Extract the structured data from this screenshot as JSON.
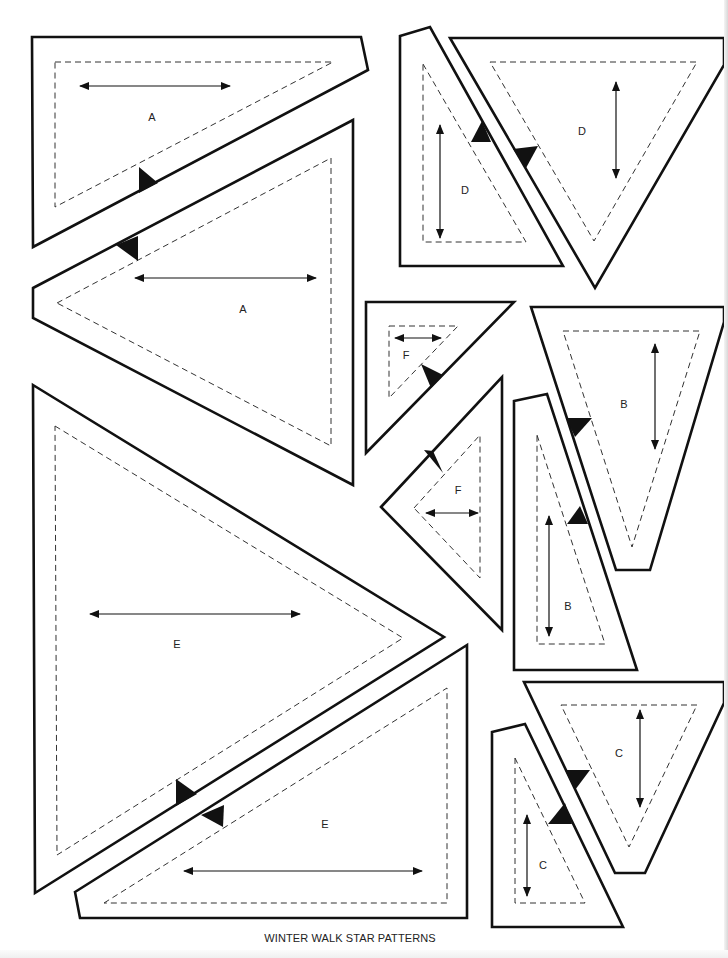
{
  "title": "WINTER WALK STAR PATTERNS",
  "colors": {
    "line": "#111111",
    "background": "#ffffff",
    "seam": "#333333"
  },
  "legend": {
    "solid_line": "cutting line",
    "dashed_line": "seam line",
    "double_arrow": "grain line",
    "black_triangle": "matching notch"
  },
  "pieces": [
    {
      "id": "A1",
      "label": "A",
      "label_pos": [
        152,
        117
      ],
      "outline": "32,37 361,37 368,70 33,247",
      "seam": "55,62 333,62 55,207",
      "grain": {
        "x1": 80,
        "y1": 86,
        "x2": 230,
        "y2": 86
      },
      "notches": [
        "139,167 139,193 158,183"
      ]
    },
    {
      "id": "A2",
      "label": "A",
      "label_pos": [
        243,
        309
      ],
      "outline": "33,288 353,120 353,485 33,318",
      "seam": "57,303 331,158 331,446",
      "grain": {
        "x1": 135,
        "y1": 278,
        "x2": 316,
        "y2": 278
      },
      "notches": [
        "116,245 138,236 138,261"
      ]
    },
    {
      "id": "D1",
      "label": "D",
      "label_pos": [
        465,
        190
      ],
      "outline": "400,36 430,27 563,266 400,266",
      "seam": "423,64 526,242 423,242",
      "grain": {
        "x1": 440,
        "y1": 125,
        "x2": 440,
        "y2": 238
      },
      "notches": [
        "471,142 491,142 482,121"
      ]
    },
    {
      "id": "D2",
      "label": "D",
      "label_pos": [
        582,
        131
      ],
      "outline": "450,38 724,38 724,65 595,288",
      "seam": "490,62 697,62 594,241",
      "grain": {
        "x1": 616,
        "y1": 82,
        "x2": 616,
        "y2": 178
      },
      "notches": [
        "513,149 538,146 526,168"
      ]
    },
    {
      "id": "F1",
      "label": "F",
      "label_pos": [
        406,
        355
      ],
      "outline": "366,302 514,302 366,453",
      "seam": "389,326 458,326 389,398",
      "grain": {
        "x1": 395,
        "y1": 338,
        "x2": 441,
        "y2": 338
      },
      "notches": [
        "421,364 443,375 431,388"
      ]
    },
    {
      "id": "F2",
      "label": "F",
      "label_pos": [
        458,
        490
      ],
      "outline": "381,507 502,377 502,630",
      "seam": "414,508 480,435 480,578",
      "grain": {
        "x1": 426,
        "y1": 513,
        "x2": 478,
        "y2": 513
      },
      "notches": [
        "424,450 443,473 433,451"
      ]
    },
    {
      "id": "B1",
      "label": "B",
      "label_pos": [
        624,
        404
      ],
      "outline": "531,307 724,307 724,322 650,570 616,570",
      "seam": "563,331 700,331 632,547",
      "grain": {
        "x1": 655,
        "y1": 344,
        "x2": 655,
        "y2": 449
      },
      "notches": [
        "566,418 592,418 575,437"
      ]
    },
    {
      "id": "B2",
      "label": "B",
      "label_pos": [
        568,
        606
      ],
      "outline": "514,401 547,394 637,670 514,670",
      "seam": "537,435 605,644 537,644",
      "grain": {
        "x1": 549,
        "y1": 516,
        "x2": 549,
        "y2": 636
      },
      "notches": [
        "567,524 588,524 580,506"
      ]
    },
    {
      "id": "E1",
      "label": "E",
      "label_pos": [
        177,
        644
      ],
      "outline": "33,385 444,637 35,893",
      "seam": "55,426 403,638 57,855",
      "grain": {
        "x1": 90,
        "y1": 614,
        "x2": 300,
        "y2": 614
      },
      "notches": [
        "176,779 176,806 197,794"
      ]
    },
    {
      "id": "E2",
      "label": "E",
      "label_pos": [
        325,
        824
      ],
      "outline": "75,892 467,645 467,918 80,918",
      "seam": "104,903 447,688 447,903",
      "grain": {
        "x1": 184,
        "y1": 871,
        "x2": 422,
        "y2": 871
      },
      "notches": [
        "201,815 224,805 223,827"
      ]
    },
    {
      "id": "C1",
      "label": "C",
      "label_pos": [
        619,
        753
      ],
      "outline": "524,682 724,682 724,703 645,873 615,873",
      "seam": "561,705 697,705 629,847",
      "grain": {
        "x1": 640,
        "y1": 710,
        "x2": 640,
        "y2": 807
      },
      "notches": [
        "565,770 590,770 575,790"
      ]
    },
    {
      "id": "C2",
      "label": "C",
      "label_pos": [
        543,
        865
      ],
      "outline": "492,732 525,724 623,927 492,927",
      "seam": "515,758 585,903 515,903",
      "grain": {
        "x1": 527,
        "y1": 815,
        "x2": 527,
        "y2": 896
      },
      "notches": [
        "548,824 572,824 565,803"
      ]
    }
  ]
}
